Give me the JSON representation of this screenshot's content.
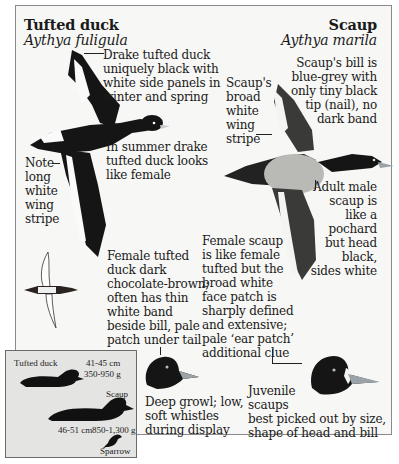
{
  "species": {
    "left": {
      "common_name": "Tufted duck",
      "latin_name": "Aythya fuligula"
    },
    "right": {
      "common_name": "Scaup",
      "latin_name": "Aythya marila"
    }
  },
  "annotations": {
    "drake_tufted": [
      "Drake tufted duck",
      "uniquely black with",
      "white side panels in",
      "winter and spring"
    ],
    "summer_drake": [
      "In summer drake",
      "tufted duck looks",
      "like female"
    ],
    "wing_stripe_tufted": [
      "Note",
      "long",
      "white",
      "wing",
      "stripe"
    ],
    "female_tufted": [
      "Female tufted",
      "duck dark",
      "chocolate-brown;",
      "often has thin",
      "white band",
      "beside bill, pale",
      "patch under tail"
    ],
    "scaup_wing_stripe": [
      "Scaup's",
      "broad",
      "white",
      "wing",
      "stripe"
    ],
    "scaup_bill": [
      "Scaup's bill is",
      "blue-grey with",
      "only tiny black",
      "tip (nail), no",
      "dark band"
    ],
    "adult_male_scaup": [
      "Adult male",
      "scaup is",
      "like a",
      "pochard",
      "but head",
      "black,",
      "sides white"
    ],
    "female_scaup": [
      "Female scaup",
      "is like female",
      "tufted but the",
      "broad white",
      "face patch is",
      "sharply defined",
      "and extensive;",
      "pale ‘ear patch’",
      "additional clue"
    ],
    "voice": [
      "Deep growl; low,",
      "soft whistles",
      "during display"
    ],
    "juvenile": [
      "Juvenile",
      "scaups",
      "best picked out by size,",
      "shape of head and bill"
    ]
  },
  "size_inset": {
    "tufted_label": "Tufted duck",
    "tufted_length": "41-45 cm",
    "tufted_weight": "350-950 g",
    "scaup_label": "Scaup",
    "scaup_length": "46-51 cm",
    "scaup_weight": "850-1,300 g",
    "sparrow_label": "Sparrow"
  },
  "colors": {
    "ink": "#1a1a1a",
    "scaup_flank": "#b9b9b5",
    "bill_blue_grey": "#9aa3a8",
    "inset_bg": "#e4e4e2"
  }
}
